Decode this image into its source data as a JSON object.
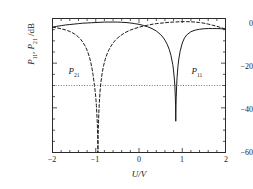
{
  "figure": {
    "background": "#ffffff",
    "frame_color": "#2b2b2b"
  },
  "axes": {
    "x": {
      "label": "U/V",
      "label_plain": "U/V",
      "min": -2,
      "max": 2,
      "ticks": [
        -2,
        -1,
        0,
        1,
        2
      ],
      "tick_labels": [
        "−2",
        "−1",
        "0",
        "1",
        "2"
      ],
      "minor_ticks_per_interval": 5
    },
    "y": {
      "label_parts": {
        "p1_base": "P",
        "p1_sub": "11",
        "sep": ", ",
        "p2_base": "P",
        "p2_sub": "21",
        "unit": " /dB"
      },
      "label_plain": "P11 , P21 /dB",
      "min": -60,
      "max": 0,
      "ticks": [
        0,
        -20,
        -40,
        -60
      ],
      "tick_labels": [
        "0",
        "−20",
        "−40",
        "−60"
      ],
      "minor_ticks_per_interval": 4
    }
  },
  "annotations": {
    "p21_label": {
      "base": "P",
      "sub": "21",
      "x_data": -1.42,
      "y_data": -24
    },
    "p11_label": {
      "base": "P",
      "sub": "11",
      "x_data": 1.42,
      "y_data": -24
    },
    "threshold_line": {
      "value_db": -30,
      "style": "dotted",
      "color": "#555555"
    }
  },
  "chart_data": {
    "type": "line",
    "title": "",
    "xlabel": "U/V",
    "ylabel": "P11 , P21 /dB",
    "xlim": [
      -2,
      2
    ],
    "ylim": [
      -60,
      0
    ],
    "grid": false,
    "legend": "none (inline curve labels)",
    "annotation_lines": [
      {
        "orientation": "horizontal",
        "value": -30,
        "style": "dotted"
      }
    ],
    "series": [
      {
        "name": "P11",
        "style": "solid",
        "color": "#1a1a1a",
        "null_position_x": 0.85,
        "null_depth_db": -60,
        "x": [
          -2.0,
          -1.9,
          -1.8,
          -1.7,
          -1.6,
          -1.5,
          -1.4,
          -1.3,
          -1.2,
          -1.1,
          -1.0,
          -0.9,
          -0.8,
          -0.7,
          -0.6,
          -0.5,
          -0.4,
          -0.3,
          -0.2,
          -0.1,
          0.0,
          0.1,
          0.2,
          0.3,
          0.4,
          0.5,
          0.55,
          0.6,
          0.65,
          0.7,
          0.74,
          0.78,
          0.8,
          0.82,
          0.83,
          0.84,
          0.845,
          0.85,
          0.855,
          0.86,
          0.87,
          0.88,
          0.9,
          0.92,
          0.95,
          1.0,
          1.05,
          1.1,
          1.2,
          1.3,
          1.4,
          1.5,
          1.6,
          1.7,
          1.8,
          1.9,
          2.0
        ],
        "y": [
          -3.9,
          -3.5,
          -3.2,
          -2.9,
          -2.7,
          -2.5,
          -2.3,
          -2.1,
          -2.0,
          -1.9,
          -1.8,
          -1.7,
          -1.6,
          -1.6,
          -1.6,
          -1.6,
          -1.7,
          -1.8,
          -2.0,
          -2.3,
          -2.6,
          -3.1,
          -3.7,
          -4.5,
          -5.6,
          -7.2,
          -8.3,
          -9.7,
          -11.5,
          -13.9,
          -16.6,
          -20.6,
          -23.5,
          -27.6,
          -30.6,
          -35.2,
          -39.0,
          -46.0,
          -39.5,
          -35.5,
          -30.0,
          -26.5,
          -21.5,
          -18.2,
          -14.8,
          -11.0,
          -8.8,
          -7.4,
          -5.9,
          -5.2,
          -4.8,
          -4.6,
          -4.5,
          -4.5,
          -4.5,
          -4.6,
          -4.7
        ]
      },
      {
        "name": "P21",
        "style": "dashed",
        "color": "#1a1a1a",
        "null_position_x": -0.95,
        "null_depth_db": -60,
        "x": [
          -2.0,
          -1.9,
          -1.8,
          -1.7,
          -1.6,
          -1.5,
          -1.45,
          -1.4,
          -1.35,
          -1.3,
          -1.25,
          -1.2,
          -1.15,
          -1.12,
          -1.09,
          -1.06,
          -1.03,
          -1.0,
          -0.985,
          -0.97,
          -0.96,
          -0.955,
          -0.95,
          -0.945,
          -0.94,
          -0.93,
          -0.92,
          -0.9,
          -0.88,
          -0.85,
          -0.82,
          -0.78,
          -0.74,
          -0.7,
          -0.65,
          -0.6,
          -0.55,
          -0.5,
          -0.4,
          -0.3,
          -0.2,
          -0.1,
          0.0,
          0.1,
          0.2,
          0.3,
          0.4,
          0.5,
          0.6,
          0.7,
          0.8,
          0.9,
          1.0,
          1.1,
          1.2,
          1.3,
          1.4,
          1.5,
          1.6,
          1.7,
          1.8,
          1.9,
          2.0
        ],
        "y": [
          -3.9,
          -4.2,
          -4.6,
          -5.1,
          -5.8,
          -6.8,
          -7.5,
          -8.3,
          -9.3,
          -10.6,
          -12.2,
          -14.2,
          -17.0,
          -19.2,
          -22.0,
          -25.5,
          -30.0,
          -35.0,
          -39.0,
          -44.5,
          -49.0,
          -53.0,
          -60.0,
          -53.0,
          -49.0,
          -43.0,
          -38.5,
          -32.5,
          -28.5,
          -24.2,
          -21.2,
          -18.2,
          -16.0,
          -14.2,
          -12.4,
          -11.0,
          -9.8,
          -8.8,
          -7.3,
          -6.1,
          -5.2,
          -4.5,
          -3.9,
          -3.4,
          -3.0,
          -2.6,
          -2.3,
          -2.1,
          -1.9,
          -1.7,
          -1.6,
          -1.5,
          -1.4,
          -1.4,
          -1.5,
          -1.6,
          -1.8,
          -2.1,
          -2.5,
          -3.0,
          -3.5,
          -4.1,
          -4.7
        ]
      }
    ]
  }
}
